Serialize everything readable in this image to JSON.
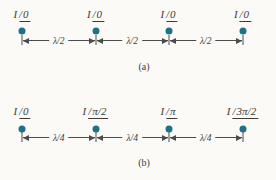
{
  "figure": {
    "arrays": [
      {
        "id": "a",
        "caption": "(a)",
        "spacing_label": "λ/2",
        "elements": [
          {
            "current": "I",
            "phase": "0"
          },
          {
            "current": "I",
            "phase": "0"
          },
          {
            "current": "I",
            "phase": "0"
          },
          {
            "current": "I",
            "phase": "0"
          }
        ]
      },
      {
        "id": "b",
        "caption": "(b)",
        "spacing_label": "λ/4",
        "elements": [
          {
            "current": "I",
            "phase": "0"
          },
          {
            "current": "I",
            "phase": "π/2"
          },
          {
            "current": "I",
            "phase": "π"
          },
          {
            "current": "I",
            "phase": "3π/2"
          }
        ]
      }
    ],
    "colors": {
      "dot": "#20708a",
      "line": "#4b4b4b",
      "text": "#403b37",
      "background": "#fbfaf7"
    }
  }
}
